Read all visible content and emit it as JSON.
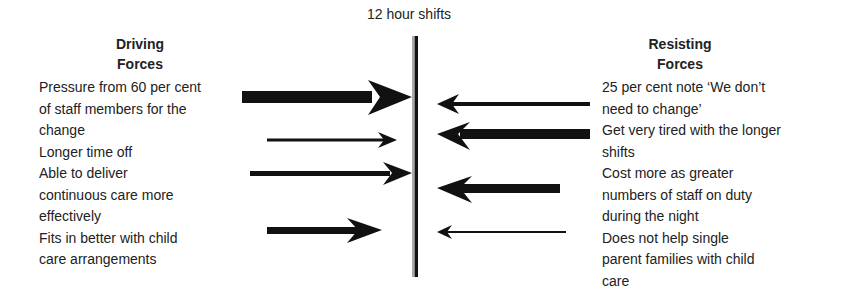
{
  "diagram": {
    "type": "force-field-analysis",
    "center_label": "12 hour shifts",
    "driving": {
      "heading": "Driving\nForces",
      "heading_line1": "Driving",
      "heading_line2": "Forces",
      "items": [
        {
          "text": "Pressure from 60 per cent\nof staff members for the\nchange",
          "strength": "strong"
        },
        {
          "text": "Longer time off",
          "strength": "weak"
        },
        {
          "text": "Able to deliver\ncontinuous care more\neffectively",
          "strength": "medium"
        },
        {
          "text": "Fits in better with child\ncare arrangements",
          "strength": "medium"
        }
      ]
    },
    "resisting": {
      "heading_line1": "Resisting",
      "heading_line2": "Forces",
      "items": [
        {
          "text": "25 per cent note ‘We don’t\nneed to change’",
          "strength": "weak"
        },
        {
          "text": "Get very tired with the longer\nshifts",
          "strength": "strong"
        },
        {
          "text": "Cost more as greater\nnumbers of staff on duty\nduring the night",
          "strength": "strong"
        },
        {
          "text": "Does not help single\nparent families with child\ncare",
          "strength": "very-weak"
        }
      ]
    },
    "colors": {
      "arrow": "#111111",
      "line": "#111111",
      "text": "#222222"
    }
  }
}
